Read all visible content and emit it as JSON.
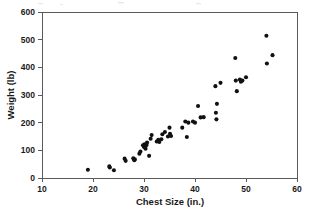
{
  "chart_data": {
    "type": "scatter",
    "title": "",
    "xlabel": "Chest Size (in.)",
    "ylabel": "Weight (lb)",
    "xlim": [
      10,
      60
    ],
    "ylim": [
      0,
      600
    ],
    "xticks": [
      10,
      20,
      30,
      40,
      50,
      60
    ],
    "yticks": [
      0,
      100,
      200,
      300,
      400,
      500,
      600
    ],
    "xtick_labels": [
      "10",
      "20",
      "30",
      "40",
      "50",
      "60"
    ],
    "ytick_labels": [
      "0",
      "100",
      "200",
      "300",
      "400",
      "500",
      "600"
    ],
    "grid": false,
    "legend": null,
    "marker": "filled-circle",
    "marker_color": "#111111",
    "points": [
      {
        "x": 19.0,
        "y": 30
      },
      {
        "x": 23.2,
        "y": 42
      },
      {
        "x": 23.3,
        "y": 38
      },
      {
        "x": 24.1,
        "y": 28
      },
      {
        "x": 26.2,
        "y": 70
      },
      {
        "x": 26.4,
        "y": 62
      },
      {
        "x": 27.9,
        "y": 71
      },
      {
        "x": 28.1,
        "y": 64
      },
      {
        "x": 28.2,
        "y": 68
      },
      {
        "x": 29.1,
        "y": 88
      },
      {
        "x": 29.3,
        "y": 96
      },
      {
        "x": 29.8,
        "y": 118
      },
      {
        "x": 30.0,
        "y": 112
      },
      {
        "x": 30.1,
        "y": 122
      },
      {
        "x": 30.3,
        "y": 106
      },
      {
        "x": 30.5,
        "y": 119
      },
      {
        "x": 30.6,
        "y": 128
      },
      {
        "x": 31.0,
        "y": 80
      },
      {
        "x": 31.3,
        "y": 142
      },
      {
        "x": 31.5,
        "y": 155
      },
      {
        "x": 32.5,
        "y": 132
      },
      {
        "x": 32.8,
        "y": 138
      },
      {
        "x": 33.0,
        "y": 130
      },
      {
        "x": 33.4,
        "y": 140
      },
      {
        "x": 33.6,
        "y": 158
      },
      {
        "x": 34.1,
        "y": 166
      },
      {
        "x": 34.7,
        "y": 150
      },
      {
        "x": 35.0,
        "y": 182
      },
      {
        "x": 35.1,
        "y": 160
      },
      {
        "x": 35.3,
        "y": 152
      },
      {
        "x": 37.5,
        "y": 182
      },
      {
        "x": 38.1,
        "y": 204
      },
      {
        "x": 38.4,
        "y": 148
      },
      {
        "x": 38.7,
        "y": 200
      },
      {
        "x": 39.6,
        "y": 204
      },
      {
        "x": 40.0,
        "y": 200
      },
      {
        "x": 40.6,
        "y": 260
      },
      {
        "x": 41.1,
        "y": 219
      },
      {
        "x": 41.7,
        "y": 220
      },
      {
        "x": 44.0,
        "y": 332
      },
      {
        "x": 44.1,
        "y": 236
      },
      {
        "x": 44.2,
        "y": 212
      },
      {
        "x": 44.3,
        "y": 268
      },
      {
        "x": 45.0,
        "y": 344
      },
      {
        "x": 47.9,
        "y": 434
      },
      {
        "x": 48.0,
        "y": 352
      },
      {
        "x": 48.2,
        "y": 314
      },
      {
        "x": 48.8,
        "y": 356
      },
      {
        "x": 49.0,
        "y": 348
      },
      {
        "x": 49.3,
        "y": 352
      },
      {
        "x": 50.0,
        "y": 364
      },
      {
        "x": 54.0,
        "y": 514
      },
      {
        "x": 54.1,
        "y": 414
      },
      {
        "x": 55.2,
        "y": 444
      }
    ]
  },
  "axes": {
    "x_title": "Chest Size (in.)",
    "y_title": "Weight (lb)"
  }
}
